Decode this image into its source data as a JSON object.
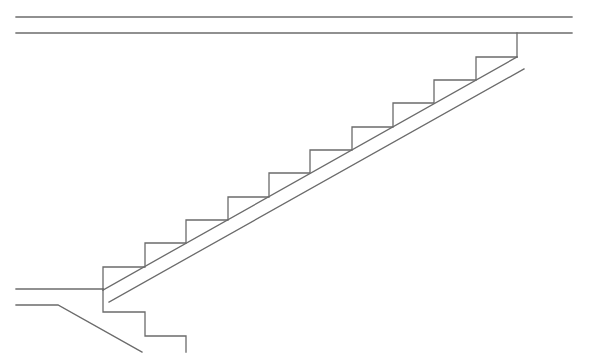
{
  "drawing": {
    "type": "staircase-section",
    "stroke_color": "#6b6b6b",
    "stroke_width": 1.3,
    "background": "#ffffff",
    "ceiling_lines": [
      {
        "x1": 16,
        "y1": 17,
        "x2": 572,
        "y2": 17
      },
      {
        "x1": 16,
        "y1": 33,
        "x2": 572,
        "y2": 33
      }
    ],
    "top_landing_vertical": {
      "x1": 517,
      "y1": 33,
      "x2": 517,
      "y2": 57
    },
    "steps_polyline": "103,290 103,267 145,267 145,243 186,243 186,220 228,220 228,197 269,197 269,173 310,173 310,150 352,150 352,127 393,127 393,103 434,103 434,80 476,80 476,57 517,57",
    "soffit_upper": {
      "x1": 103,
      "y1": 290,
      "x2": 517,
      "y2": 57
    },
    "soffit_lower": {
      "x1": 109,
      "y1": 302,
      "x2": 524,
      "y2": 69
    },
    "left_floor_line": {
      "x1": 16,
      "y1": 289,
      "x2": 103,
      "y2": 289
    },
    "left_lower_line": "16,305 58,305 142,352",
    "bottom_steps_polyline": "103,289 103,312 145,312 145,336 186,336 186,352"
  }
}
